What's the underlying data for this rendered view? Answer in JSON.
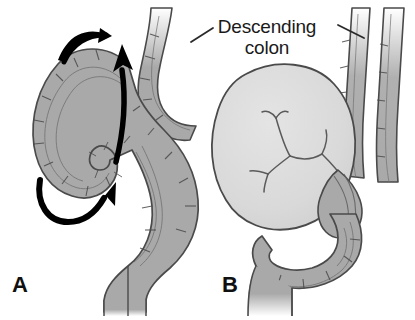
{
  "figure": {
    "background_color": "#ffffff"
  },
  "annotations": {
    "descending_colon_label": "Descending\ncolon",
    "descending_colon_label_line1": "Descending",
    "descending_colon_label_line2": "colon"
  },
  "panels": [
    {
      "letter": "A",
      "caption": "Sigmoid loop with rotational arrows showing twisting direction"
    },
    {
      "letter": "B",
      "caption": "Distended twisted sigmoid loop (volvulus) with closed-loop obstruction"
    }
  ],
  "colors": {
    "bowel_fill": "#a9a9a9",
    "bowel_fill_light": "#b8b8b8",
    "mass_fill": "#dcdcdc",
    "outline": "#4a4a4a",
    "vessel_line": "#5a5a5a",
    "arrow": "#000000",
    "text": "#1a1a1a",
    "leader_line": "#2a2a2a"
  },
  "graphics": {
    "arrows": [
      {
        "name": "upper-curved-rotation-arrow",
        "direction": "clockwise-top"
      },
      {
        "name": "vertical-rotation-arrow",
        "direction": "upward"
      },
      {
        "name": "lower-curved-rotation-arrow",
        "direction": "counterclockwise-bottom"
      }
    ],
    "leader_lines": [
      {
        "name": "leader-line-left",
        "points_to": "left descending colon segment"
      },
      {
        "name": "leader-line-right",
        "points_to": "right descending colon segment"
      }
    ]
  }
}
